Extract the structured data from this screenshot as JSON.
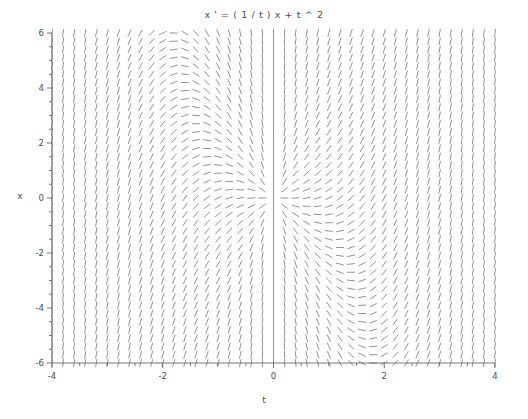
{
  "chart_data": {
    "type": "quiver",
    "title": "x ' = ( 1 / t ) x + t ^ 2",
    "equation": "x' = (1/t)x + t^2",
    "xlabel": "t",
    "ylabel": "x",
    "xlim": [
      -4,
      4
    ],
    "ylim": [
      -6,
      6
    ],
    "xticks": [
      -4,
      -2,
      0,
      2,
      4
    ],
    "xtick_labels": [
      "-4",
      "-2",
      "0",
      "2",
      "4"
    ],
    "yticks": [
      -6,
      -4,
      -2,
      0,
      2,
      4,
      6
    ],
    "ytick_labels": [
      "-6",
      "-4",
      "-2",
      "0",
      "2",
      "4",
      "6"
    ],
    "x_minor_step": 0.5,
    "y_minor_step": 0.5,
    "grid": false,
    "legend": null,
    "field": {
      "description": "Slope field of dx/dt = x/t + t^2; each mark is a short dash whose angle equals arctan of the slope at that point.",
      "slope_formula": "x/t + t*t",
      "nx": 41,
      "ny": 41,
      "dash_length_px": 8.0,
      "singular_line_t": 0,
      "color": "#808080"
    },
    "samples": [
      {
        "t": -4.0,
        "x": 4.0,
        "slope": 15.0
      },
      {
        "t": -2.0,
        "x": 2.0,
        "slope": 3.0
      },
      {
        "t": -1.0,
        "x": 0.0,
        "slope": 1.0
      },
      {
        "t": -0.5,
        "x": 1.0,
        "slope": -1.75
      },
      {
        "t": 0.5,
        "x": -1.0,
        "slope": -1.75
      },
      {
        "t": 1.0,
        "x": 0.0,
        "slope": 1.0
      },
      {
        "t": 2.0,
        "x": -2.0,
        "slope": 3.0
      },
      {
        "t": 3.0,
        "x": -6.0,
        "slope": 7.0
      },
      {
        "t": 4.0,
        "x": 4.0,
        "slope": 17.0
      }
    ]
  },
  "axes": {
    "title": "x ' = ( 1 / t ) x + t ^ 2",
    "xlabel": "t",
    "ylabel": "x",
    "spine_color": "#666666",
    "tick_color": "#666666",
    "text_color": "#4d4d4d",
    "background": "#ffffff"
  }
}
